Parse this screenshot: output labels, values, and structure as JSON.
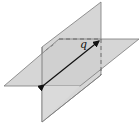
{
  "diagram": {
    "line_label": "q",
    "colors": {
      "plane_fill": "#d3d3d3",
      "edge": "#7a7a7a",
      "line": "#111111",
      "background": "#ffffff"
    }
  }
}
